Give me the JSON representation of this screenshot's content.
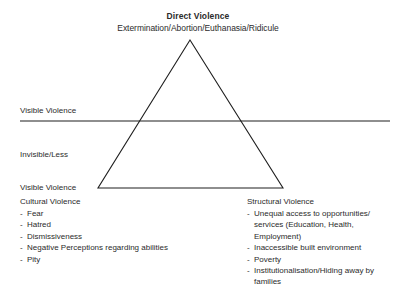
{
  "diagram": {
    "apex": {
      "heading": "Direct Violence",
      "subheading": "Extermination/Abortion/Euthanasia/Ridicule"
    },
    "divider": {
      "above_label": "Visible Violence",
      "below_label_line1": "Invisible/Less",
      "below_label_line2": "Visible Violence"
    },
    "left_column": {
      "heading": "Cultural Violence",
      "bullet_marker": "-",
      "items": [
        "Fear",
        "Hatred",
        "Dismissiveness",
        "Negative Perceptions regarding abilities",
        "Pity"
      ]
    },
    "right_column": {
      "heading": "Structural Violence",
      "bullet_marker": "-",
      "items": [
        "Unequal access to opportunities/ services (Education, Health, Employment)",
        "Inaccessible built environment",
        "Poverty",
        "Institutionalisation/Hiding away by families"
      ]
    },
    "colors": {
      "background": "#ffffff",
      "text": "#2b2b2b",
      "stroke": "#1f1f1f"
    },
    "shapes": {
      "triangle_apex": {
        "x": 190,
        "y": 40
      },
      "triangle_base_left": {
        "x": 98,
        "y": 188
      },
      "triangle_base_right": {
        "x": 283,
        "y": 188
      },
      "divider_line_y": 121,
      "divider_line_x_start": 20,
      "divider_line_x_end": 390
    }
  }
}
